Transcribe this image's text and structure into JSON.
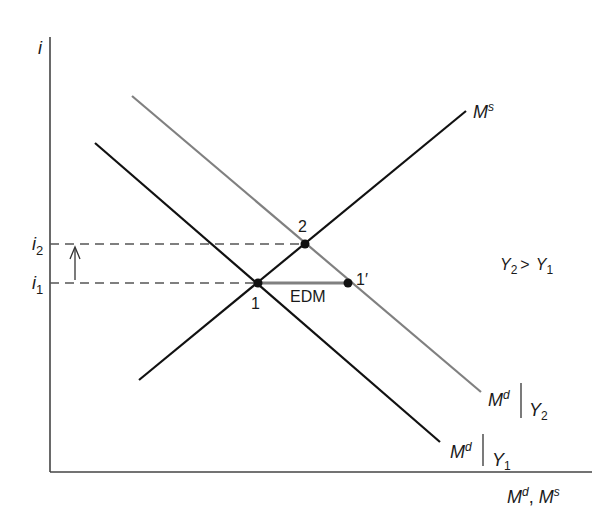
{
  "diagram": {
    "title": "",
    "axes": {
      "y_label": "i",
      "x_label_main1": "M",
      "x_label_sup1": "d",
      "x_label_sep": ", ",
      "x_label_main2": "M",
      "x_label_sup2": "s"
    },
    "levels": {
      "i2": {
        "main": "i",
        "sub": "2"
      },
      "i1": {
        "main": "i",
        "sub": "1"
      }
    },
    "curves": {
      "ms": {
        "main": "M",
        "sup": "s",
        "color": "#111111"
      },
      "md_y2": {
        "main": "M",
        "sup": "d",
        "cond": "Y",
        "sub": "2",
        "color": "#808080"
      },
      "md_y1": {
        "main": "M",
        "sup": "d",
        "cond": "Y",
        "sub": "1",
        "color": "#111111"
      }
    },
    "points": {
      "p1": "1",
      "p2": "2",
      "p1prime": "1′"
    },
    "annotations": {
      "edm": "EDM",
      "condition_y2": "Y",
      "condition_sub2": "2",
      "condition_gt": ">",
      "condition_y1": "Y",
      "condition_sub1": "1"
    },
    "colors": {
      "axis": "#444444",
      "dash": "#555555",
      "edm_segment": "#808080",
      "point": "#111111"
    }
  }
}
